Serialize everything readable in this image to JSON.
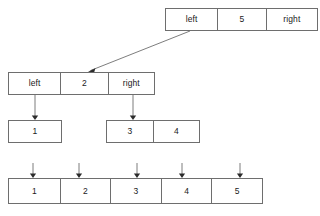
{
  "diagram": {
    "line_color": "#6e6e6e",
    "arrow_color": "#2b2b2b",
    "text_color": "#1a1a1a",
    "background": "#ffffff"
  },
  "nodes": {
    "root": {
      "name": "root-node",
      "left_label": "left",
      "value": "5",
      "right_label": "right"
    },
    "level2": {
      "name": "left-child-node",
      "left_label": "left",
      "value": "2",
      "right_label": "right"
    },
    "leaf_one": {
      "name": "leaf-node-one",
      "value": "1"
    },
    "leaf_pair": {
      "name": "leaf-node-pair",
      "first": "3",
      "second": "4"
    },
    "array": {
      "name": "result-array",
      "cells": [
        "1",
        "2",
        "3",
        "4",
        "5"
      ]
    }
  },
  "edges": [
    {
      "name": "edge-root-to-left-child",
      "from": "root",
      "to": "level2",
      "style": "diagonal-arrow"
    },
    {
      "name": "edge-level2-to-leaf-one",
      "from": "level2",
      "to": "leaf_one",
      "style": "vertical-arrow"
    },
    {
      "name": "edge-level2-to-leaf-pair",
      "from": "level2",
      "to": "leaf_pair",
      "style": "vertical-arrow"
    },
    {
      "name": "edge-to-array-cell-1",
      "from": "leaf_one",
      "to": "array.0",
      "style": "vertical-arrow"
    },
    {
      "name": "edge-to-array-cell-2",
      "from": "level2",
      "to": "array.1",
      "style": "vertical-arrow"
    },
    {
      "name": "edge-to-array-cell-3",
      "from": "leaf_pair",
      "to": "array.2",
      "style": "vertical-arrow"
    },
    {
      "name": "edge-to-array-cell-4",
      "from": "leaf_pair",
      "to": "array.3",
      "style": "vertical-arrow"
    },
    {
      "name": "edge-to-array-cell-5",
      "from": "root",
      "to": "array.4",
      "style": "vertical-arrow"
    }
  ]
}
